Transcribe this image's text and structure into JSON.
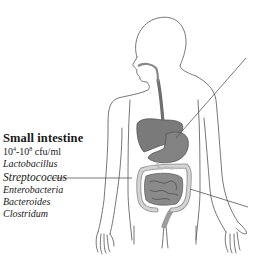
{
  "diagram": {
    "type": "anatomical-illustration",
    "colors": {
      "outline": "#555555",
      "organ_fill": "#7a7a7a",
      "organ_light": "#c8c8c8",
      "text": "#1a1a1a",
      "leader_line": "#555555"
    }
  },
  "label": {
    "title": "Small intestine",
    "count_base_low": "10",
    "count_exp_low": "4",
    "count_sep": "-10",
    "count_exp_high": "8",
    "count_unit": " cfu/ml",
    "organisms": [
      "Lactobacillus",
      "Streptococcus",
      "Enterobacteria",
      "Bacteroides",
      "Clostridum"
    ]
  }
}
